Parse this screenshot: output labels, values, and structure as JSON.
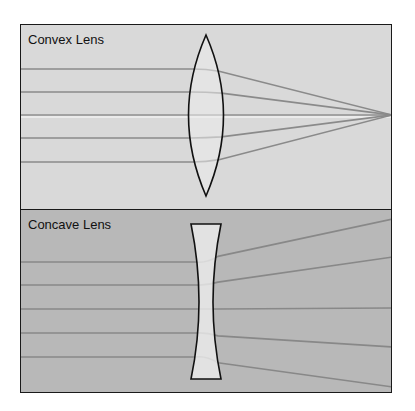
{
  "convex": {
    "title": "Convex Lens",
    "bg": "#d9d9d9",
    "lens_fill": "#ececec",
    "ray_color": "#8a8a8a",
    "ray_y": [
      44,
      67,
      90,
      113,
      137
    ],
    "focal_point": [
      371,
      90
    ]
  },
  "concave": {
    "title": "Concave Lens",
    "bg": "#b8b8b8",
    "lens_fill": "#ececec",
    "ray_color": "#888888",
    "ray_y": [
      52,
      75,
      99,
      123,
      147
    ],
    "exit_y": [
      9,
      47,
      98,
      137,
      177
    ]
  }
}
